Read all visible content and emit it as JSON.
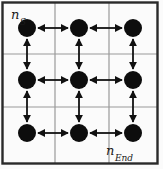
{
  "figure": {
    "type": "lattice-graph-diagram",
    "width": 163,
    "height": 169,
    "background_color": "#fbfbfb",
    "border_color": "#2a2a2a",
    "grid_line_color": "#9a9a9a",
    "node_color": "#0d0d0d",
    "edge_color": "#111111"
  },
  "labels": {
    "start": {
      "base": "n",
      "sub": "S",
      "full": "n_S"
    },
    "end": {
      "base": "n",
      "sub": "End",
      "full": "n_End"
    }
  },
  "graph": {
    "rows": 3,
    "cols": 3,
    "node_radius": 9,
    "node_count": 9,
    "nodes": [
      {
        "id": "n00",
        "row": 0,
        "col": 0,
        "x": 27,
        "y": 28,
        "label": "n_S"
      },
      {
        "id": "n01",
        "row": 0,
        "col": 1,
        "x": 79,
        "y": 28,
        "label": ""
      },
      {
        "id": "n02",
        "row": 0,
        "col": 2,
        "x": 133,
        "y": 28,
        "label": ""
      },
      {
        "id": "n10",
        "row": 1,
        "col": 0,
        "x": 27,
        "y": 80,
        "label": ""
      },
      {
        "id": "n11",
        "row": 1,
        "col": 1,
        "x": 79,
        "y": 80,
        "label": ""
      },
      {
        "id": "n12",
        "row": 1,
        "col": 2,
        "x": 133,
        "y": 80,
        "label": ""
      },
      {
        "id": "n20",
        "row": 2,
        "col": 0,
        "x": 27,
        "y": 133,
        "label": ""
      },
      {
        "id": "n21",
        "row": 2,
        "col": 1,
        "x": 79,
        "y": 133,
        "label": ""
      },
      {
        "id": "n22",
        "row": 2,
        "col": 2,
        "x": 133,
        "y": 133,
        "label": "n_End"
      }
    ],
    "edges": [
      {
        "from": "n00",
        "to": "n01",
        "direction": "bidirectional",
        "orientation": "horizontal"
      },
      {
        "from": "n01",
        "to": "n02",
        "direction": "bidirectional",
        "orientation": "horizontal"
      },
      {
        "from": "n10",
        "to": "n11",
        "direction": "bidirectional",
        "orientation": "horizontal"
      },
      {
        "from": "n11",
        "to": "n12",
        "direction": "bidirectional",
        "orientation": "horizontal"
      },
      {
        "from": "n20",
        "to": "n21",
        "direction": "bidirectional",
        "orientation": "horizontal"
      },
      {
        "from": "n21",
        "to": "n22",
        "direction": "bidirectional",
        "orientation": "horizontal"
      },
      {
        "from": "n00",
        "to": "n10",
        "direction": "bidirectional",
        "orientation": "vertical"
      },
      {
        "from": "n10",
        "to": "n20",
        "direction": "bidirectional",
        "orientation": "vertical"
      },
      {
        "from": "n01",
        "to": "n11",
        "direction": "bidirectional",
        "orientation": "vertical"
      },
      {
        "from": "n11",
        "to": "n21",
        "direction": "bidirectional",
        "orientation": "vertical"
      },
      {
        "from": "n02",
        "to": "n12",
        "direction": "bidirectional",
        "orientation": "vertical"
      },
      {
        "from": "n12",
        "to": "n22",
        "direction": "bidirectional",
        "orientation": "vertical"
      }
    ]
  },
  "grid": {
    "vertical_lines_x": [
      55,
      109
    ],
    "horizontal_lines_y": [
      54,
      107
    ],
    "outer_border": {
      "x": 2,
      "y": 2,
      "width": 156,
      "height": 162
    }
  }
}
